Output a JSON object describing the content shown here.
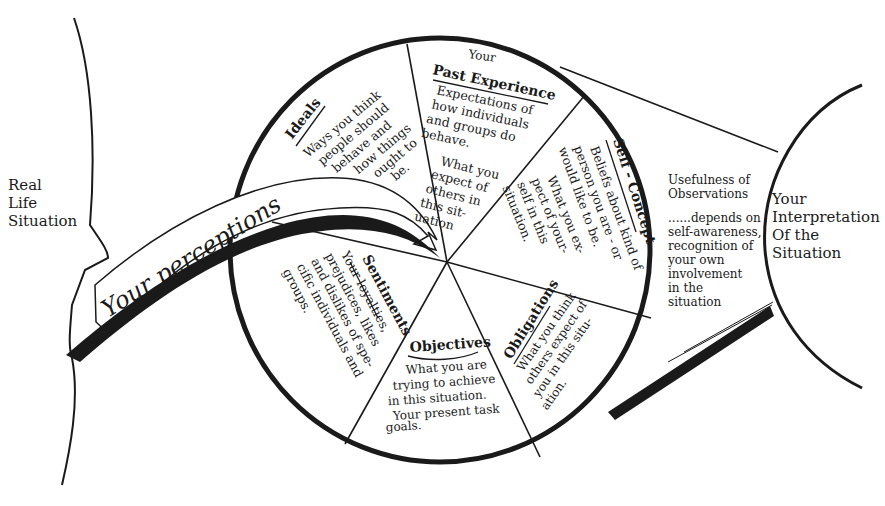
{
  "diagram": {
    "type": "perception-process-diagram",
    "left_region": {
      "label_lines": [
        "Real",
        "Life",
        "Situation"
      ]
    },
    "ribbon": {
      "label": "Your perceptions"
    },
    "wheel": {
      "segments": [
        {
          "id": "ideals",
          "title": "Ideals",
          "body_lines": [
            "Ways you think",
            "people should",
            "behave and",
            "how things",
            "ought to",
            "be."
          ],
          "emphasis": [
            "should",
            "ought"
          ]
        },
        {
          "id": "past-experience",
          "title_prefix": "Your",
          "title": "Past Experience",
          "body_lines": [
            "Expectations of",
            "how individuals",
            "and groups do",
            "behave.",
            "What you",
            "expect of",
            "others in",
            "this sit-",
            "uation"
          ],
          "emphasis": [
            "do"
          ]
        },
        {
          "id": "self-concept",
          "title": "Self - Concept",
          "body_lines": [
            "Beliefs about kind of",
            "person you are - or",
            "would like to be.",
            "What you ex-",
            "pect of your-",
            "self in this",
            "situation."
          ]
        },
        {
          "id": "obligations",
          "title": "Obligations",
          "body_lines": [
            "What you think",
            "others expect of",
            "you in this situ-",
            "ation."
          ]
        },
        {
          "id": "objectives",
          "title": "Objectives",
          "body_lines": [
            "What you are",
            "trying to achieve",
            "in this situation.",
            "Your present task",
            "goals."
          ]
        },
        {
          "id": "sentiments",
          "title": "Sentiments",
          "body_lines": [
            "Your loyalties,",
            "prejudices, likes",
            "and dislikes of spe-",
            "cific individuals and",
            "groups."
          ]
        }
      ]
    },
    "lens_note": {
      "title_lines": [
        "Usefulness of",
        "Observations"
      ],
      "body_lines": [
        "......depends on",
        "self-awareness,",
        "recognition of",
        "your own",
        "involvement",
        "in the",
        "situation"
      ]
    },
    "right_region": {
      "label_lines": [
        "Your",
        "Interpretation",
        "Of the",
        "Situation"
      ]
    },
    "colors": {
      "ink": "#1a1a1a",
      "paper": "#ffffff"
    }
  }
}
